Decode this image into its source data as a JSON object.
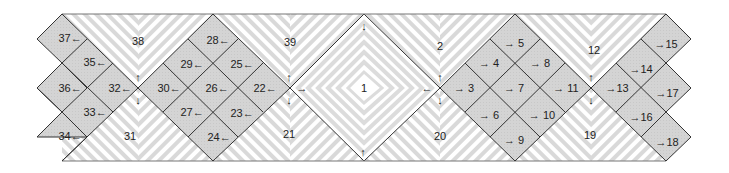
{
  "diagram": {
    "colors": {
      "cell_fill": "#d2d2d2",
      "stroke": "#333333",
      "stripe_dark": "#d6d6d6",
      "stripe_light": "#ffffff",
      "band_edge": "#777777"
    },
    "center_zone": {
      "id": "1",
      "label": "1"
    },
    "triangle_zones": [
      {
        "id": "38",
        "label": "38",
        "position": "top",
        "x": 138
      },
      {
        "id": "39",
        "label": "39",
        "position": "top",
        "x": 290
      },
      {
        "id": "2",
        "label": "2",
        "position": "top",
        "x": 440
      },
      {
        "id": "12",
        "label": "12",
        "position": "top",
        "x": 591
      },
      {
        "id": "31",
        "label": "31",
        "position": "bottom",
        "x": 138
      },
      {
        "id": "21",
        "label": "21",
        "position": "bottom",
        "x": 290
      },
      {
        "id": "20",
        "label": "20",
        "position": "bottom",
        "x": 440
      },
      {
        "id": "19",
        "label": "19",
        "position": "bottom",
        "x": 591
      }
    ],
    "right_cells": [
      {
        "label": "3",
        "arrow": "→"
      },
      {
        "label": "4",
        "arrow": "→"
      },
      {
        "label": "5",
        "arrow": "→"
      },
      {
        "label": "6",
        "arrow": "→"
      },
      {
        "label": "7",
        "arrow": "→"
      },
      {
        "label": "8",
        "arrow": "→"
      },
      {
        "label": "9",
        "arrow": "→"
      },
      {
        "label": "10",
        "arrow": "→"
      },
      {
        "label": "11",
        "arrow": "→"
      },
      {
        "label": "13",
        "arrow": "→"
      },
      {
        "label": "14",
        "arrow": "→"
      },
      {
        "label": "15",
        "arrow": "→"
      },
      {
        "label": "16",
        "arrow": "→"
      },
      {
        "label": "17",
        "arrow": "→"
      },
      {
        "label": "18",
        "arrow": "→"
      }
    ],
    "left_cells": [
      {
        "label": "22",
        "arrow": "←"
      },
      {
        "label": "23",
        "arrow": "←"
      },
      {
        "label": "24",
        "arrow": "←"
      },
      {
        "label": "25",
        "arrow": "←"
      },
      {
        "label": "26",
        "arrow": "←"
      },
      {
        "label": "27",
        "arrow": "←"
      },
      {
        "label": "28",
        "arrow": "←"
      },
      {
        "label": "29",
        "arrow": "←"
      },
      {
        "label": "30",
        "arrow": "←"
      },
      {
        "label": "32",
        "arrow": "←"
      },
      {
        "label": "33",
        "arrow": "←"
      },
      {
        "label": "34",
        "arrow": "←"
      },
      {
        "label": "35",
        "arrow": "←"
      },
      {
        "label": "36",
        "arrow": "←"
      },
      {
        "label": "37",
        "arrow": "←"
      }
    ],
    "junction_arrows": {
      "up": "↑",
      "down": "↓",
      "left": "←",
      "right": "→"
    }
  }
}
